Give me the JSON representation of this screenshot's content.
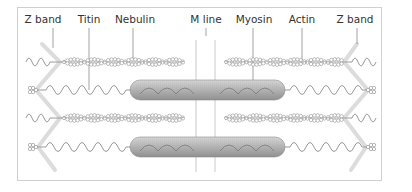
{
  "diagram": {
    "labels": [
      {
        "id": "z-band-left",
        "text": "Z band",
        "x": 43,
        "y": 23
      },
      {
        "id": "titin",
        "text": "Titin",
        "x": 89,
        "y": 23
      },
      {
        "id": "nebulin",
        "text": "Nebulin",
        "x": 135,
        "y": 23
      },
      {
        "id": "m-line",
        "text": "M line",
        "x": 206,
        "y": 23
      },
      {
        "id": "myosin",
        "text": "Myosin",
        "x": 254,
        "y": 23
      },
      {
        "id": "actin",
        "text": "Actin",
        "x": 302,
        "y": 23
      },
      {
        "id": "z-band-right",
        "text": "Z band",
        "x": 355,
        "y": 23
      }
    ],
    "colors": {
      "frame": "#cfcfcf",
      "z_band": "#d9d9d9",
      "filament": "#9a9a9a",
      "myosin_fill": "#b5b5b5",
      "leader": "#8a8a8a",
      "text": "#333333"
    }
  }
}
